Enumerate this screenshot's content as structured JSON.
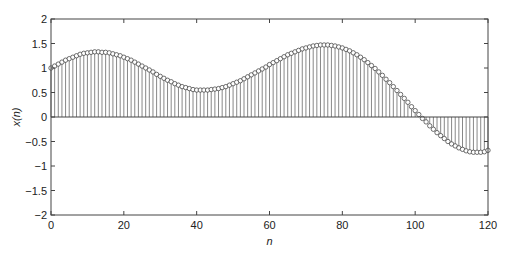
{
  "chart_data": {
    "type": "stem",
    "title": "",
    "xlabel": "n",
    "ylabel": "x(n)",
    "xlim": [
      0,
      120
    ],
    "ylim": [
      -2,
      2
    ],
    "xticks": [
      0,
      20,
      40,
      60,
      80,
      100,
      120
    ],
    "yticks": [
      -2,
      -1.5,
      -1,
      -0.5,
      0,
      0.5,
      1,
      1.5,
      2
    ],
    "xtick_labels": [
      "0",
      "20",
      "40",
      "60",
      "80",
      "100",
      "120"
    ],
    "ytick_labels": [
      "−2",
      "−1.5",
      "−1",
      "−0.5",
      "0",
      "0.5",
      "1",
      "1.5",
      "2"
    ],
    "grid": false,
    "legend": null,
    "marker": "open-circle",
    "colors": {
      "line": "#555555",
      "axis": "#444444",
      "marker_edge": "#333333",
      "marker_fill": "#ffffff"
    },
    "x": [
      0,
      1,
      2,
      3,
      4,
      5,
      6,
      7,
      8,
      9,
      10,
      11,
      12,
      13,
      14,
      15,
      16,
      17,
      18,
      19,
      20,
      21,
      22,
      23,
      24,
      25,
      26,
      27,
      28,
      29,
      30,
      31,
      32,
      33,
      34,
      35,
      36,
      37,
      38,
      39,
      40,
      41,
      42,
      43,
      44,
      45,
      46,
      47,
      48,
      49,
      50,
      51,
      52,
      53,
      54,
      55,
      56,
      57,
      58,
      59,
      60,
      61,
      62,
      63,
      64,
      65,
      66,
      67,
      68,
      69,
      70,
      71,
      72,
      73,
      74,
      75,
      76,
      77,
      78,
      79,
      80,
      81,
      82,
      83,
      84,
      85,
      86,
      87,
      88,
      89,
      90,
      91,
      92,
      93,
      94,
      95,
      96,
      97,
      98,
      99,
      100,
      101,
      102,
      103,
      104,
      105,
      106,
      107,
      108,
      109,
      110,
      111,
      112,
      113,
      114,
      115,
      116,
      117,
      118,
      119,
      120
    ],
    "values": [
      1.0,
      1.04,
      1.08,
      1.12,
      1.16,
      1.19,
      1.22,
      1.25,
      1.28,
      1.3,
      1.31,
      1.32,
      1.33,
      1.33,
      1.32,
      1.32,
      1.31,
      1.29,
      1.27,
      1.25,
      1.22,
      1.19,
      1.16,
      1.12,
      1.08,
      1.04,
      1.0,
      0.96,
      0.92,
      0.87,
      0.83,
      0.79,
      0.75,
      0.72,
      0.68,
      0.65,
      0.62,
      0.6,
      0.58,
      0.56,
      0.55,
      0.55,
      0.55,
      0.55,
      0.56,
      0.57,
      0.58,
      0.6,
      0.62,
      0.65,
      0.68,
      0.71,
      0.74,
      0.78,
      0.82,
      0.86,
      0.9,
      0.94,
      0.98,
      1.02,
      1.07,
      1.11,
      1.15,
      1.19,
      1.23,
      1.27,
      1.3,
      1.33,
      1.36,
      1.39,
      1.41,
      1.43,
      1.45,
      1.46,
      1.47,
      1.47,
      1.47,
      1.46,
      1.45,
      1.43,
      1.41,
      1.38,
      1.35,
      1.31,
      1.27,
      1.22,
      1.17,
      1.11,
      1.05,
      0.99,
      0.92,
      0.85,
      0.77,
      0.7,
      0.62,
      0.54,
      0.46,
      0.38,
      0.3,
      0.21,
      0.13,
      0.05,
      -0.03,
      -0.1,
      -0.18,
      -0.25,
      -0.32,
      -0.38,
      -0.44,
      -0.5,
      -0.55,
      -0.59,
      -0.63,
      -0.66,
      -0.69,
      -0.71,
      -0.72,
      -0.72,
      -0.72,
      -0.71,
      -0.68
    ]
  }
}
